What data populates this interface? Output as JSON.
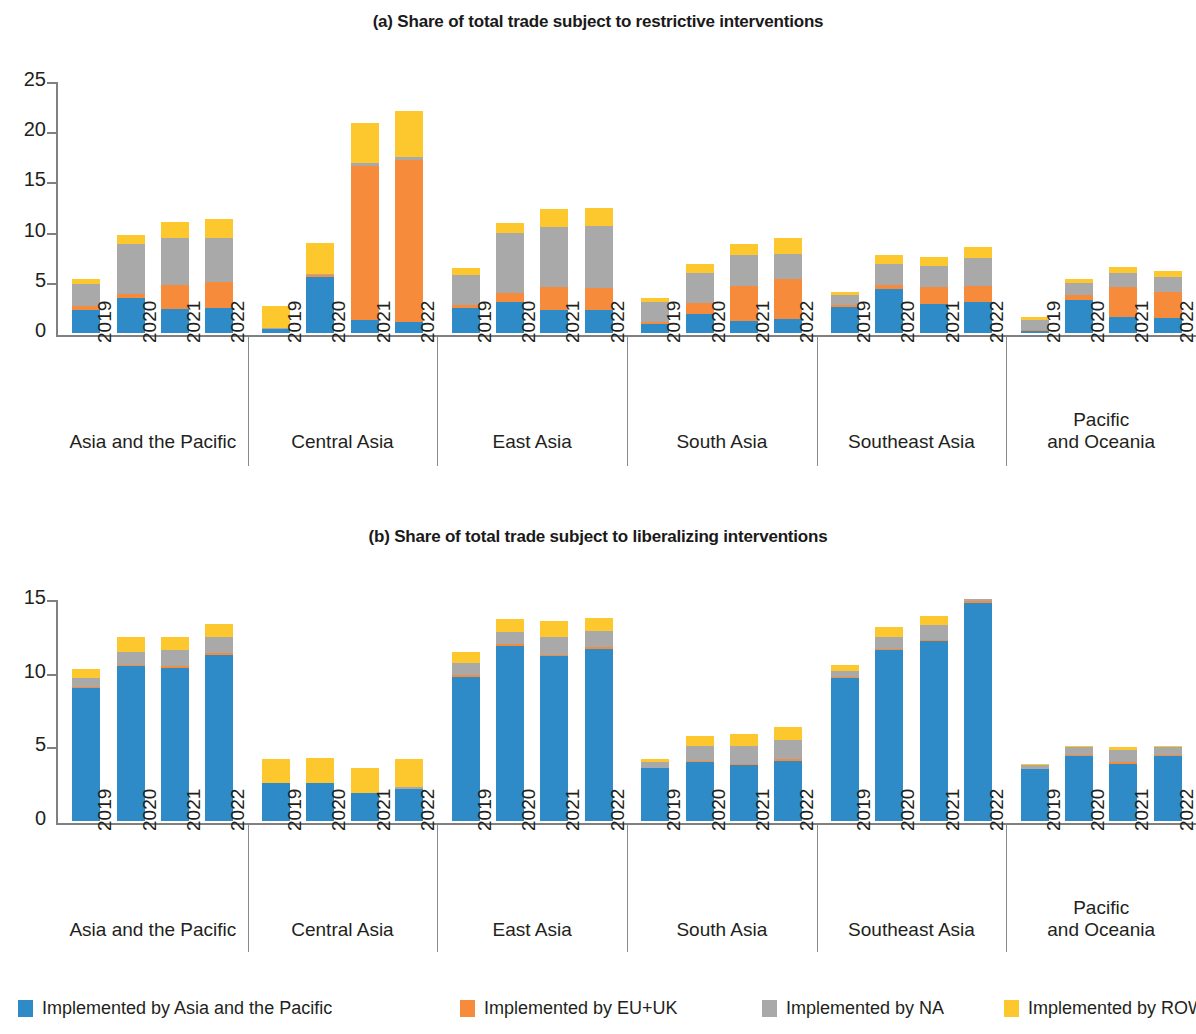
{
  "figure": {
    "panel_a_title": "(a) Share of total trade subject to restrictive interventions",
    "panel_b_title": "(b) Share of total trade subject to liberalizing interventions"
  },
  "legend": {
    "position": "bottom",
    "items": [
      {
        "label": "Implemented by Asia and the Pacific",
        "color": "#2e8bc8",
        "key": "asia_pacific"
      },
      {
        "label": "Implemented by EU+UK",
        "color": "#f68b3c",
        "key": "eu_uk"
      },
      {
        "label": "Implemented by NA",
        "color": "#a9a9a9",
        "key": "na"
      },
      {
        "label": "Implemented by ROW",
        "color": "#fdc72e",
        "key": "row"
      }
    ]
  },
  "groups": [
    {
      "label": "Asia and the Pacific",
      "label_lines": [
        "Asia and the Pacific"
      ]
    },
    {
      "label": "Central Asia",
      "label_lines": [
        "Central Asia"
      ]
    },
    {
      "label": "East Asia",
      "label_lines": [
        "East Asia"
      ]
    },
    {
      "label": "South Asia",
      "label_lines": [
        "South Asia"
      ]
    },
    {
      "label": "Southeast Asia",
      "label_lines": [
        "Southeast Asia"
      ]
    },
    {
      "label": "Pacific and Oceania",
      "label_lines": [
        "Pacific",
        "and Oceania"
      ]
    }
  ],
  "years": [
    "2019",
    "2020",
    "2021",
    "2022"
  ],
  "chart_data": [
    {
      "type": "bar",
      "stacked": true,
      "id": "panel-a",
      "title": "(a) Share of total trade subject to restrictive interventions",
      "xlabel": "",
      "ylabel": "",
      "ylim": [
        0,
        25
      ],
      "yticks": [
        0,
        5,
        10,
        15,
        20,
        25
      ],
      "ytick_labels": [
        "0",
        "5",
        "10",
        "15",
        "20",
        "25"
      ],
      "grid": false,
      "legend_position": "bottom",
      "categories": [
        "2019",
        "2020",
        "2021",
        "2022"
      ],
      "group_order": [
        "Asia and the Pacific",
        "Central Asia",
        "East Asia",
        "South Asia",
        "Southeast Asia",
        "Pacific and Oceania"
      ],
      "series_names": [
        "Implemented by Asia and the Pacific",
        "Implemented by EU+UK",
        "Implemented by NA",
        "Implemented by ROW"
      ],
      "series_colors": [
        "#2e8bc8",
        "#f68b3c",
        "#a9a9a9",
        "#fdc72e"
      ],
      "data": {
        "Asia and the Pacific": {
          "2019": [
            2.3,
            0.4,
            2.2,
            0.5
          ],
          "2020": [
            3.5,
            0.4,
            5.0,
            0.9
          ],
          "2021": [
            2.4,
            2.4,
            4.7,
            1.6
          ],
          "2022": [
            2.5,
            2.6,
            4.4,
            1.9
          ]
        },
        "Central Asia": {
          "2019": [
            0.4,
            0.0,
            0.1,
            2.2
          ],
          "2020": [
            5.6,
            0.2,
            0.1,
            3.1
          ],
          "2021": [
            1.3,
            15.3,
            0.3,
            4.0
          ],
          "2022": [
            1.1,
            16.1,
            0.3,
            4.6
          ]
        },
        "East Asia": {
          "2019": [
            2.5,
            0.3,
            3.0,
            0.7
          ],
          "2020": [
            3.1,
            0.9,
            6.0,
            1.0
          ],
          "2021": [
            2.3,
            2.3,
            6.0,
            1.8
          ],
          "2022": [
            2.3,
            2.2,
            6.2,
            1.8
          ]
        },
        "South Asia": {
          "2019": [
            0.9,
            0.2,
            2.0,
            0.4
          ],
          "2020": [
            1.9,
            1.1,
            3.0,
            0.9
          ],
          "2021": [
            1.2,
            3.5,
            3.1,
            1.1
          ],
          "2022": [
            1.4,
            4.0,
            2.5,
            1.6
          ]
        },
        "Southeast Asia": {
          "2019": [
            2.6,
            0.2,
            1.0,
            0.3
          ],
          "2020": [
            4.4,
            0.4,
            2.1,
            0.9
          ],
          "2021": [
            2.9,
            1.7,
            2.1,
            0.9
          ],
          "2022": [
            3.1,
            1.6,
            2.8,
            1.1
          ]
        },
        "Pacific and Oceania": {
          "2019": [
            0.2,
            0.1,
            1.0,
            0.3
          ],
          "2020": [
            3.3,
            0.5,
            1.2,
            0.4
          ],
          "2021": [
            1.6,
            3.0,
            1.4,
            0.6
          ],
          "2022": [
            1.5,
            2.6,
            1.5,
            0.6
          ]
        }
      }
    },
    {
      "type": "bar",
      "stacked": true,
      "id": "panel-b",
      "title": "(b) Share of total trade subject to liberalizing interventions",
      "xlabel": "",
      "ylabel": "",
      "ylim": [
        0,
        15
      ],
      "yticks": [
        0,
        5,
        10,
        15
      ],
      "ytick_labels": [
        "0",
        "5",
        "10",
        "15"
      ],
      "grid": false,
      "legend_position": "bottom",
      "categories": [
        "2019",
        "2020",
        "2021",
        "2022"
      ],
      "group_order": [
        "Asia and the Pacific",
        "Central Asia",
        "East Asia",
        "South Asia",
        "Southeast Asia",
        "Pacific and Oceania"
      ],
      "series_names": [
        "Implemented by Asia and the Pacific",
        "Implemented by EU+UK",
        "Implemented by NA",
        "Implemented by ROW"
      ],
      "series_colors": [
        "#2e8bc8",
        "#f68b3c",
        "#a9a9a9",
        "#fdc72e"
      ],
      "data": {
        "Asia and the Pacific": {
          "2019": [
            9.0,
            0.1,
            0.6,
            0.6
          ],
          "2020": [
            10.5,
            0.1,
            0.9,
            1.0
          ],
          "2021": [
            10.4,
            0.1,
            1.1,
            0.9
          ],
          "2022": [
            11.3,
            0.1,
            1.1,
            0.9
          ]
        },
        "Central Asia": {
          "2019": [
            2.6,
            0.0,
            0.0,
            1.6
          ],
          "2020": [
            2.6,
            0.0,
            0.0,
            1.7
          ],
          "2021": [
            1.9,
            0.0,
            0.0,
            1.7
          ],
          "2022": [
            2.2,
            0.0,
            0.1,
            1.9
          ]
        },
        "East Asia": {
          "2019": [
            9.8,
            0.1,
            0.8,
            0.8
          ],
          "2020": [
            11.9,
            0.1,
            0.8,
            0.9
          ],
          "2021": [
            11.2,
            0.1,
            1.2,
            1.1
          ],
          "2022": [
            11.7,
            0.1,
            1.1,
            0.9
          ]
        },
        "South Asia": {
          "2019": [
            3.6,
            0.0,
            0.4,
            0.2
          ],
          "2020": [
            4.0,
            0.1,
            1.0,
            0.7
          ],
          "2021": [
            3.8,
            0.1,
            1.2,
            0.8
          ],
          "2022": [
            4.1,
            0.1,
            1.3,
            0.9
          ]
        },
        "Southeast Asia": {
          "2019": [
            9.7,
            0.1,
            0.4,
            0.4
          ],
          "2020": [
            11.6,
            0.1,
            0.8,
            0.7
          ],
          "2021": [
            12.2,
            0.1,
            1.0,
            0.6
          ],
          "2022": [
            14.8,
            0.1,
            0.2,
            0.0
          ]
        },
        "Pacific and Oceania": {
          "2019": [
            3.5,
            0.0,
            0.3,
            0.1
          ],
          "2020": [
            4.4,
            0.1,
            0.5,
            0.1
          ],
          "2021": [
            3.9,
            0.1,
            0.8,
            0.2
          ],
          "2022": [
            4.4,
            0.1,
            0.5,
            0.1
          ]
        }
      }
    }
  ]
}
